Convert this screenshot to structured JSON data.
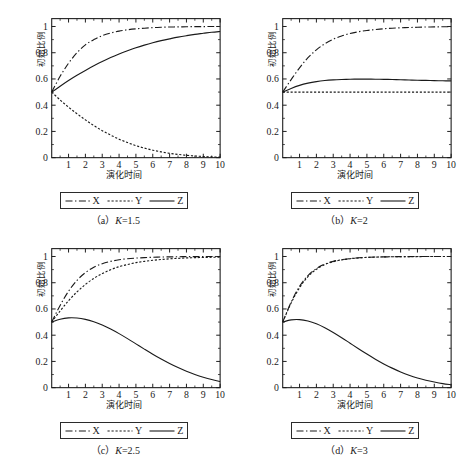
{
  "figure": {
    "axis": {
      "xlabel": "演化时间",
      "ylabel": "初始比例",
      "xticks": [
        "1",
        "2",
        "3",
        "4",
        "5",
        "6",
        "7",
        "8",
        "9",
        "10"
      ],
      "yticks": [
        "0",
        "0.2",
        "0.4",
        "0.6",
        "0.8",
        "1"
      ],
      "xlim": [
        0,
        10
      ],
      "ylim": [
        0,
        1.06
      ]
    },
    "legend": {
      "items": [
        {
          "label": "X",
          "style": "dash-dot"
        },
        {
          "label": "Y",
          "style": "dotted"
        },
        {
          "label": "Z",
          "style": "solid"
        }
      ]
    },
    "line_color": "#1a1a1a"
  },
  "chart_data": [
    {
      "type": "line",
      "panel": "a",
      "caption_prefix": "（a）",
      "caption_param": "K",
      "caption_value": "=1.5",
      "title": "(a) K=1.5",
      "xlabel": "演化时间",
      "ylabel": "初始比例",
      "xlim": [
        0,
        10
      ],
      "ylim": [
        0,
        1.06
      ],
      "grid": false,
      "legend_position": "below-axes",
      "x": [
        0,
        0.5,
        1,
        1.5,
        2,
        2.5,
        3,
        3.5,
        4,
        4.5,
        5,
        5.5,
        6,
        6.5,
        7,
        7.5,
        8,
        8.5,
        9,
        9.5,
        10
      ],
      "series": [
        {
          "name": "X",
          "style": "dash-dot",
          "values": [
            0.5,
            0.62,
            0.72,
            0.8,
            0.86,
            0.9,
            0.93,
            0.95,
            0.965,
            0.975,
            0.982,
            0.987,
            0.991,
            0.994,
            0.996,
            0.997,
            0.998,
            0.999,
            0.999,
            1.0,
            1.0
          ]
        },
        {
          "name": "Y",
          "style": "dotted",
          "values": [
            0.5,
            0.44,
            0.385,
            0.335,
            0.288,
            0.245,
            0.206,
            0.172,
            0.141,
            0.115,
            0.092,
            0.073,
            0.057,
            0.044,
            0.033,
            0.025,
            0.018,
            0.013,
            0.009,
            0.006,
            0.004
          ]
        },
        {
          "name": "Z",
          "style": "solid",
          "values": [
            0.5,
            0.545,
            0.588,
            0.628,
            0.665,
            0.7,
            0.733,
            0.763,
            0.79,
            0.815,
            0.838,
            0.858,
            0.876,
            0.892,
            0.906,
            0.919,
            0.93,
            0.94,
            0.948,
            0.956,
            0.962
          ]
        }
      ]
    },
    {
      "type": "line",
      "panel": "b",
      "caption_prefix": "（b）",
      "caption_param": "K",
      "caption_value": "=2",
      "title": "(b) K=2",
      "xlabel": "演化时间",
      "ylabel": "初始比例",
      "xlim": [
        0,
        10
      ],
      "ylim": [
        0,
        1.06
      ],
      "grid": false,
      "legend_position": "below-axes",
      "x": [
        0,
        0.5,
        1,
        1.5,
        2,
        2.5,
        3,
        3.5,
        4,
        4.5,
        5,
        5.5,
        6,
        6.5,
        7,
        7.5,
        8,
        8.5,
        9,
        9.5,
        10
      ],
      "series": [
        {
          "name": "X",
          "style": "dash-dot",
          "values": [
            0.5,
            0.595,
            0.685,
            0.762,
            0.822,
            0.868,
            0.903,
            0.928,
            0.947,
            0.96,
            0.97,
            0.977,
            0.983,
            0.987,
            0.99,
            0.992,
            0.994,
            0.996,
            0.997,
            0.998,
            0.998
          ]
        },
        {
          "name": "Y",
          "style": "dotted",
          "values": [
            0.5,
            0.5,
            0.5,
            0.5,
            0.5,
            0.5,
            0.5,
            0.5,
            0.5,
            0.5,
            0.5,
            0.5,
            0.5,
            0.5,
            0.5,
            0.5,
            0.5,
            0.5,
            0.5,
            0.5,
            0.5
          ]
        },
        {
          "name": "Z",
          "style": "solid",
          "values": [
            0.5,
            0.528,
            0.551,
            0.568,
            0.58,
            0.588,
            0.593,
            0.596,
            0.598,
            0.599,
            0.599,
            0.598,
            0.597,
            0.596,
            0.594,
            0.592,
            0.59,
            0.589,
            0.587,
            0.586,
            0.585
          ]
        }
      ]
    },
    {
      "type": "line",
      "panel": "c",
      "caption_prefix": "（c）",
      "caption_param": "K",
      "caption_value": "=2.5",
      "title": "(c) K=2.5",
      "xlabel": "演化时间",
      "ylabel": "初始比例",
      "xlim": [
        0,
        10
      ],
      "ylim": [
        0,
        1.06
      ],
      "grid": false,
      "legend_position": "below-axes",
      "x": [
        0,
        0.5,
        1,
        1.5,
        2,
        2.5,
        3,
        3.5,
        4,
        4.5,
        5,
        5.5,
        6,
        6.5,
        7,
        7.5,
        8,
        8.5,
        9,
        9.5,
        10
      ],
      "series": [
        {
          "name": "X",
          "style": "dash-dot",
          "values": [
            0.5,
            0.627,
            0.735,
            0.818,
            0.877,
            0.918,
            0.945,
            0.963,
            0.975,
            0.983,
            0.988,
            0.991,
            0.994,
            0.996,
            0.997,
            0.998,
            0.999,
            0.999,
            0.999,
            1.0,
            1.0
          ]
        },
        {
          "name": "Y",
          "style": "dotted",
          "values": [
            0.5,
            0.585,
            0.663,
            0.73,
            0.787,
            0.833,
            0.87,
            0.899,
            0.922,
            0.939,
            0.953,
            0.963,
            0.971,
            0.977,
            0.982,
            0.986,
            0.989,
            0.991,
            0.993,
            0.994,
            0.995
          ]
        },
        {
          "name": "Z",
          "style": "solid",
          "values": [
            0.5,
            0.522,
            0.532,
            0.531,
            0.521,
            0.503,
            0.478,
            0.447,
            0.412,
            0.374,
            0.334,
            0.294,
            0.255,
            0.218,
            0.184,
            0.153,
            0.125,
            0.101,
            0.08,
            0.062,
            0.047
          ]
        }
      ]
    },
    {
      "type": "line",
      "panel": "d",
      "caption_prefix": "（d）",
      "caption_param": "K",
      "caption_value": "=3",
      "title": "(d) K=3",
      "xlabel": "演化时间",
      "ylabel": "初始比例",
      "xlim": [
        0,
        10
      ],
      "ylim": [
        0,
        1.06
      ],
      "grid": false,
      "legend_position": "below-axes",
      "x": [
        0,
        0.5,
        1,
        1.5,
        2,
        2.5,
        3,
        3.5,
        4,
        4.5,
        5,
        5.5,
        6,
        6.5,
        7,
        7.5,
        8,
        8.5,
        9,
        9.5,
        10
      ],
      "series": [
        {
          "name": "X",
          "style": "dash-dot",
          "values": [
            0.5,
            0.652,
            0.772,
            0.855,
            0.908,
            0.942,
            0.963,
            0.976,
            0.984,
            0.99,
            0.993,
            0.996,
            0.997,
            0.998,
            0.999,
            0.999,
            1.0,
            1.0,
            1.0,
            1.0,
            1.0
          ]
        },
        {
          "name": "Y",
          "style": "dotted",
          "values": [
            0.5,
            0.645,
            0.762,
            0.847,
            0.903,
            0.938,
            0.96,
            0.974,
            0.983,
            0.989,
            0.993,
            0.995,
            0.997,
            0.998,
            0.998,
            0.999,
            0.999,
            1.0,
            1.0,
            1.0,
            1.0
          ]
        },
        {
          "name": "Z",
          "style": "solid",
          "values": [
            0.5,
            0.517,
            0.519,
            0.508,
            0.487,
            0.457,
            0.421,
            0.381,
            0.339,
            0.297,
            0.256,
            0.217,
            0.181,
            0.149,
            0.12,
            0.095,
            0.074,
            0.057,
            0.043,
            0.031,
            0.022
          ]
        }
      ]
    }
  ]
}
